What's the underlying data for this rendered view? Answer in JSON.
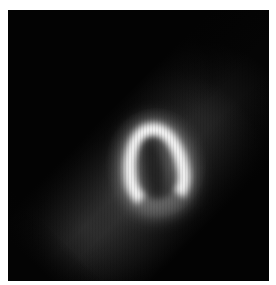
{
  "image": {
    "subject": "grayscale cardiac nuclear imaging slice showing horseshoe-shaped left ventricle uptake",
    "frame": {
      "left": 8,
      "top": 10,
      "width": 261,
      "height": 271
    },
    "colors": {
      "background": "#ffffff",
      "frame": "#050505",
      "hotspot": "#f4f4f4"
    }
  }
}
